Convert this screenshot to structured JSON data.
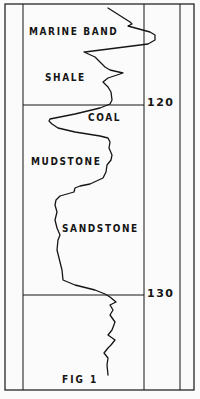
{
  "figure": {
    "caption": "FIG 1",
    "colors": {
      "ink": "#151515",
      "paper": "#fbfbfb"
    }
  },
  "labels": {
    "marine_band": "MARINE BAND",
    "shale": "SHALE",
    "coal": "COAL",
    "mudstone": "MUDSTONE",
    "sandstone": "SANDSTONE"
  },
  "depth_markers": {
    "d120": "120",
    "d130": "130"
  },
  "chart_data": {
    "type": "line",
    "title": "FIG 1",
    "xlabel": "",
    "ylabel": "Depth",
    "y_ticks": [
      120,
      130
    ],
    "orientation": "vertical log (depth increases downward)",
    "grid": false,
    "legend": null,
    "annotations": [
      "MARINE BAND",
      "SHALE",
      "COAL",
      "MUDSTONE",
      "SANDSTONE"
    ],
    "lithology_intervals": [
      {
        "unit": "MARINE BAND",
        "position": "top, above ~117"
      },
      {
        "unit": "SHALE",
        "position": "~116–120"
      },
      {
        "unit": "COAL",
        "position": "just below 120"
      },
      {
        "unit": "MUDSTONE",
        "position": "~122–124"
      },
      {
        "unit": "SANDSTONE",
        "position": "~124–130"
      },
      {
        "unit": "(unlabeled)",
        "position": "below 130"
      }
    ],
    "log_trace_pixels": [
      [
        108,
        8
      ],
      [
        130,
        22
      ],
      [
        132,
        24
      ],
      [
        128,
        26
      ],
      [
        150,
        32
      ],
      [
        155,
        35
      ],
      [
        155,
        40
      ],
      [
        148,
        44
      ],
      [
        85,
        52
      ],
      [
        84,
        52
      ],
      [
        95,
        57
      ],
      [
        100,
        62
      ],
      [
        105,
        67
      ],
      [
        110,
        70
      ],
      [
        123,
        73
      ],
      [
        108,
        78
      ],
      [
        103,
        82
      ],
      [
        108,
        87
      ],
      [
        111,
        92
      ],
      [
        112,
        100
      ],
      [
        110,
        104
      ],
      [
        100,
        108
      ],
      [
        75,
        114
      ],
      [
        50,
        119
      ],
      [
        49,
        121
      ],
      [
        52,
        124
      ],
      [
        58,
        128
      ],
      [
        75,
        132
      ],
      [
        100,
        136
      ],
      [
        108,
        138
      ],
      [
        110,
        142
      ],
      [
        109,
        148
      ],
      [
        112,
        155
      ],
      [
        111,
        160
      ],
      [
        107,
        165
      ],
      [
        106,
        172
      ],
      [
        103,
        178
      ],
      [
        90,
        184
      ],
      [
        80,
        186
      ],
      [
        75,
        188
      ],
      [
        74,
        192
      ],
      [
        60,
        196
      ],
      [
        56,
        200
      ],
      [
        55,
        205
      ],
      [
        57,
        212
      ],
      [
        55,
        220
      ],
      [
        57,
        228
      ],
      [
        60,
        235
      ],
      [
        58,
        240
      ],
      [
        57,
        250
      ],
      [
        60,
        262
      ],
      [
        62,
        270
      ],
      [
        63,
        280
      ],
      [
        75,
        285
      ],
      [
        95,
        290
      ],
      [
        105,
        294
      ],
      [
        110,
        297
      ],
      [
        116,
        302
      ],
      [
        110,
        305
      ],
      [
        113,
        310
      ],
      [
        110,
        315
      ],
      [
        115,
        322
      ],
      [
        112,
        330
      ],
      [
        108,
        335
      ],
      [
        115,
        340
      ],
      [
        111,
        345
      ],
      [
        108,
        348
      ],
      [
        104,
        353
      ],
      [
        108,
        358
      ],
      [
        107,
        365
      ],
      [
        108,
        375
      ]
    ]
  }
}
